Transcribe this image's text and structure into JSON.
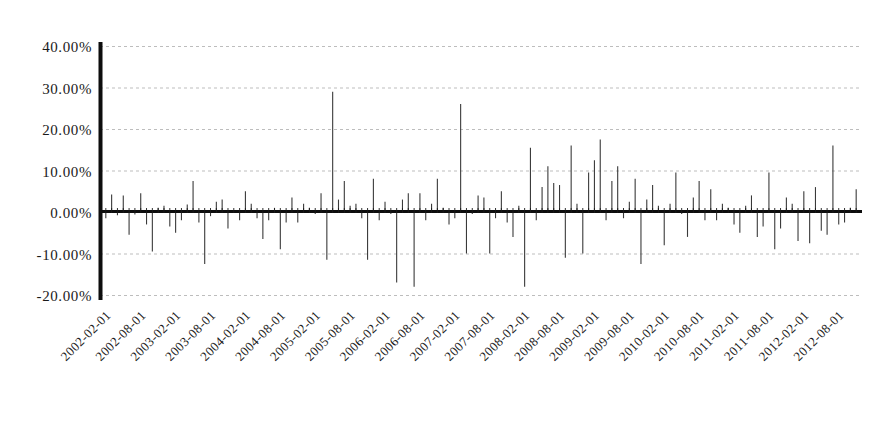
{
  "chart_data": {
    "type": "bar",
    "title": "",
    "subtitle": "",
    "xlabel": "",
    "ylabel": "",
    "ylim": [
      -20,
      40
    ],
    "ytick_labels": [
      "40.00%",
      "30.00%",
      "20.00%",
      "10.00%",
      "0.00%",
      "-10.00%",
      "-20.00%"
    ],
    "ytick_values": [
      40,
      30,
      20,
      10,
      0,
      -10,
      -20
    ],
    "grid": true,
    "legend": "none",
    "xtick_labels": [
      "2002-02-01",
      "2002-08-01",
      "2003-02-01",
      "2003-08-01",
      "2004-02-01",
      "2004-08-01",
      "2005-02-01",
      "2005-08-01",
      "2006-02-01",
      "2006-08-01",
      "2007-02-01",
      "2007-08-01",
      "2008-02-01",
      "2008-08-01",
      "2009-02-01",
      "2009-08-01",
      "2010-02-01",
      "2010-08-01",
      "2011-02-01",
      "2011-08-01",
      "2012-02-01",
      "2012-08-01"
    ],
    "categories": [
      "2002-01-01",
      "2002-02-01",
      "2002-03-01",
      "2002-04-01",
      "2002-05-01",
      "2002-06-01",
      "2002-07-01",
      "2002-08-01",
      "2002-09-01",
      "2002-10-01",
      "2002-11-01",
      "2002-12-01",
      "2003-01-01",
      "2003-02-01",
      "2003-03-01",
      "2003-04-01",
      "2003-05-01",
      "2003-06-01",
      "2003-07-01",
      "2003-08-01",
      "2003-09-01",
      "2003-10-01",
      "2003-11-01",
      "2003-12-01",
      "2004-01-01",
      "2004-02-01",
      "2004-03-01",
      "2004-04-01",
      "2004-05-01",
      "2004-06-01",
      "2004-07-01",
      "2004-08-01",
      "2004-09-01",
      "2004-10-01",
      "2004-11-01",
      "2004-12-01",
      "2005-01-01",
      "2005-02-01",
      "2005-03-01",
      "2005-04-01",
      "2005-05-01",
      "2005-06-01",
      "2005-07-01",
      "2005-08-01",
      "2005-09-01",
      "2005-10-01",
      "2005-11-01",
      "2005-12-01",
      "2006-01-01",
      "2006-02-01",
      "2006-03-01",
      "2006-04-01",
      "2006-05-01",
      "2006-06-01",
      "2006-07-01",
      "2006-08-01",
      "2006-09-01",
      "2006-10-01",
      "2006-11-01",
      "2006-12-01",
      "2007-01-01",
      "2007-02-01",
      "2007-03-01",
      "2007-04-01",
      "2007-05-01",
      "2007-06-01",
      "2007-07-01",
      "2007-08-01",
      "2007-09-01",
      "2007-10-01",
      "2007-11-01",
      "2007-12-01",
      "2008-01-01",
      "2008-02-01",
      "2008-03-01",
      "2008-04-01",
      "2008-05-01",
      "2008-06-01",
      "2008-07-01",
      "2008-08-01",
      "2008-09-01",
      "2008-10-01",
      "2008-11-01",
      "2008-12-01",
      "2009-01-01",
      "2009-02-01",
      "2009-03-01",
      "2009-04-01",
      "2009-05-01",
      "2009-06-01",
      "2009-07-01",
      "2009-08-01",
      "2009-09-01",
      "2009-10-01",
      "2009-11-01",
      "2009-12-01",
      "2010-01-01",
      "2010-02-01",
      "2010-03-01",
      "2010-04-01",
      "2010-05-01",
      "2010-06-01",
      "2010-07-01",
      "2010-08-01",
      "2010-09-01",
      "2010-10-01",
      "2010-11-01",
      "2010-12-01",
      "2011-01-01",
      "2011-02-01",
      "2011-03-01",
      "2011-04-01",
      "2011-05-01",
      "2011-06-01",
      "2011-07-01",
      "2011-08-01",
      "2011-09-01",
      "2011-10-01",
      "2011-11-01",
      "2011-12-01",
      "2012-01-01",
      "2012-02-01",
      "2012-03-01",
      "2012-04-01",
      "2012-05-01",
      "2012-06-01",
      "2012-07-01",
      "2012-08-01",
      "2012-09-01",
      "2012-10-01"
    ],
    "values": [
      -1.5,
      4.2,
      -0.8,
      4.0,
      -5.5,
      -0.6,
      4.5,
      -3.0,
      -9.5,
      1.0,
      1.5,
      -3.5,
      -5.0,
      -2.0,
      1.8,
      7.5,
      -2.5,
      -12.5,
      -1.0,
      2.5,
      3.0,
      -4.0,
      0.5,
      -2.0,
      5.0,
      2.0,
      -1.5,
      -6.5,
      -2.0,
      1.0,
      -9.0,
      -2.5,
      3.5,
      -2.5,
      2.0,
      1.0,
      -0.5,
      4.5,
      -11.5,
      29.0,
      3.0,
      7.5,
      1.5,
      2.0,
      -1.5,
      -11.5,
      8.0,
      -2.0,
      2.5,
      -0.5,
      -17.0,
      3.0,
      4.5,
      -18.0,
      4.5,
      -2.0,
      2.0,
      8.0,
      1.0,
      -3.0,
      -1.5,
      26.0,
      -10.0,
      -0.5,
      4.0,
      3.5,
      -10.0,
      -1.5,
      5.0,
      -2.5,
      -6.0,
      1.5,
      -18.0,
      15.5,
      -2.0,
      6.0,
      11.0,
      7.0,
      6.5,
      -11.0,
      16.0,
      2.0,
      -10.0,
      9.5,
      12.5,
      17.5,
      -2.0,
      7.5,
      11.0,
      -1.5,
      2.5,
      8.0,
      -12.5,
      3.0,
      6.5,
      1.5,
      -8.0,
      2.0,
      9.5,
      -0.5,
      -6.0,
      3.5,
      7.5,
      -2.0,
      5.5,
      -2.0,
      2.0,
      1.0,
      -3.0,
      -5.0,
      1.5,
      4.0,
      -6.0,
      -3.5,
      9.5,
      -9.0,
      -4.0,
      3.5,
      2.0,
      -7.0,
      5.0,
      -7.5,
      6.0,
      -4.5,
      -5.5,
      16.0,
      -3.0,
      -2.5,
      1.0,
      5.5
    ]
  }
}
